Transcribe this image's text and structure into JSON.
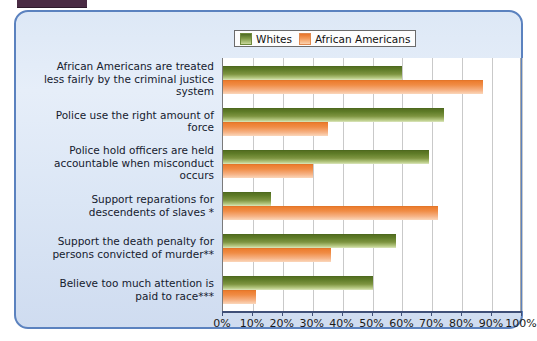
{
  "panel": {
    "accent_border": "#5b82bf",
    "background_from": "#dde8f6",
    "background_to": "#cfdcf0"
  },
  "legend": {
    "position": "top-right",
    "entries": [
      {
        "label": "Whites",
        "color": "#7f9a46",
        "swatch": "green-swatch"
      },
      {
        "label": "African Americans",
        "color": "#f29a5a",
        "swatch": "orange-swatch"
      }
    ]
  },
  "chart_data": {
    "type": "bar",
    "orientation": "horizontal",
    "title": "",
    "xlabel": "",
    "ylabel": "",
    "xlim": [
      0,
      100
    ],
    "grid": true,
    "legend_position": "top-right",
    "categories": [
      "African Americans are treated less fairly by the criminal justice system",
      "Police use the right amount of force",
      "Police hold officers are held accountable when misconduct occurs",
      "Support reparations for descendents of slaves *",
      "Support the death penalty for persons convicted of murder**",
      "Believe too much attention is paid to race***"
    ],
    "series": [
      {
        "name": "Whites",
        "color": "#7f9a46",
        "values": [
          60,
          74,
          69,
          16,
          58,
          50
        ]
      },
      {
        "name": "African Americans",
        "color": "#f29a5a",
        "values": [
          87,
          35,
          30,
          72,
          36,
          11
        ]
      }
    ],
    "tick_labels": [
      "0%",
      "10%",
      "20%",
      "30%",
      "40%",
      "50%",
      "60%",
      "70%",
      "80%",
      "90%",
      "100%"
    ],
    "tick_values": [
      0,
      10,
      20,
      30,
      40,
      50,
      60,
      70,
      80,
      90,
      100
    ]
  }
}
